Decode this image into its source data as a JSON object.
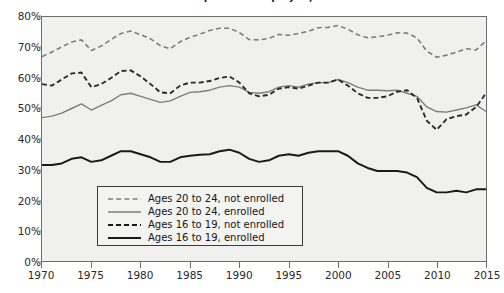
{
  "chart_data": {
    "type": "line",
    "title": "Percent of Population Employed, 1970-2015",
    "xlabel": "",
    "ylabel": "",
    "xlim": [
      1970,
      2015
    ],
    "ylim": [
      0,
      80
    ],
    "grid": false,
    "legend_position": "lower-left-inside",
    "x_tick_labels": [
      "1970",
      "1975",
      "1980",
      "1985",
      "1990",
      "1995",
      "2000",
      "2005",
      "2010",
      "2015"
    ],
    "x_tick_values": [
      1970,
      1975,
      1980,
      1985,
      1990,
      1995,
      2000,
      2005,
      2010,
      2015
    ],
    "y_tick_labels": [
      "0%",
      "10%",
      "20%",
      "30%",
      "40%",
      "50%",
      "60%",
      "70%",
      "80%"
    ],
    "y_tick_values": [
      0,
      10,
      20,
      30,
      40,
      50,
      60,
      70,
      80
    ],
    "x": [
      1970,
      1971,
      1972,
      1973,
      1974,
      1975,
      1976,
      1977,
      1978,
      1979,
      1980,
      1981,
      1982,
      1983,
      1984,
      1985,
      1986,
      1987,
      1988,
      1989,
      1990,
      1991,
      1992,
      1993,
      1994,
      1995,
      1996,
      1997,
      1998,
      1999,
      2000,
      2001,
      2002,
      2003,
      2004,
      2005,
      2006,
      2007,
      2008,
      2009,
      2010,
      2011,
      2012,
      2013,
      2014,
      2015
    ],
    "series": [
      {
        "name": "Ages 20 to 24, not enrolled",
        "style": "dashed-light",
        "color": "#7d7d7d",
        "values": [
          67.0,
          68.5,
          70.2,
          71.8,
          72.5,
          69.0,
          70.5,
          72.6,
          74.6,
          75.4,
          74.2,
          72.8,
          70.6,
          69.6,
          71.9,
          73.3,
          74.4,
          75.6,
          76.3,
          76.3,
          74.9,
          72.6,
          72.5,
          73.0,
          74.3,
          74.0,
          74.6,
          75.3,
          76.5,
          76.6,
          77.2,
          76.0,
          74.2,
          73.2,
          73.5,
          74.0,
          74.8,
          74.7,
          73.2,
          68.8,
          66.8,
          67.5,
          68.5,
          69.6,
          69.2,
          72.2
        ]
      },
      {
        "name": "Ages 20 to 24, enrolled",
        "style": "solid-light",
        "color": "#7d7d7d",
        "values": [
          47.0,
          47.5,
          48.5,
          50.0,
          51.5,
          49.5,
          51.0,
          52.5,
          54.5,
          55.0,
          54.0,
          53.0,
          52.0,
          52.5,
          54.0,
          55.3,
          55.5,
          56.0,
          57.0,
          57.5,
          57.0,
          55.3,
          55.0,
          55.5,
          57.0,
          57.5,
          57.0,
          58.0,
          58.5,
          58.5,
          59.5,
          58.5,
          57.0,
          56.0,
          56.0,
          55.8,
          56.0,
          55.0,
          54.0,
          50.5,
          49.0,
          48.8,
          49.5,
          50.2,
          51.2,
          49.0
        ]
      },
      {
        "name": "Ages 16 to 19, not enrolled",
        "style": "dashed-dark",
        "color": "#2a2a2a",
        "values": [
          58.0,
          57.5,
          59.5,
          61.5,
          61.8,
          57.0,
          58.0,
          60.0,
          62.3,
          62.5,
          60.5,
          58.0,
          55.3,
          55.0,
          57.5,
          58.5,
          58.5,
          59.0,
          60.0,
          60.5,
          58.5,
          55.0,
          54.0,
          54.5,
          56.5,
          57.0,
          56.5,
          57.5,
          58.5,
          58.5,
          59.5,
          57.5,
          55.0,
          53.5,
          53.5,
          54.0,
          55.5,
          56.0,
          53.5,
          46.0,
          43.0,
          46.5,
          47.5,
          48.0,
          50.5,
          55.0
        ]
      },
      {
        "name": "Ages 16 to 19, enrolled",
        "style": "solid-dark",
        "color": "#1a1a1a",
        "values": [
          31.5,
          31.5,
          32.0,
          33.5,
          34.0,
          32.5,
          33.0,
          34.5,
          36.0,
          36.0,
          35.0,
          34.0,
          32.5,
          32.5,
          34.0,
          34.5,
          34.8,
          35.0,
          36.0,
          36.5,
          35.5,
          33.5,
          32.5,
          33.0,
          34.5,
          35.0,
          34.5,
          35.5,
          36.0,
          36.0,
          36.0,
          34.5,
          32.0,
          30.5,
          29.5,
          29.5,
          29.5,
          29.0,
          27.5,
          24.0,
          22.5,
          22.5,
          23.0,
          22.5,
          23.5,
          23.5
        ]
      }
    ]
  },
  "legend": {
    "items": [
      {
        "label": "Ages 20 to 24, not enrolled",
        "style": "dashed-light"
      },
      {
        "label": "Ages 20 to 24, enrolled",
        "style": "solid-light"
      },
      {
        "label": "Ages 16 to 19, not enrolled",
        "style": "dashed-dark"
      },
      {
        "label": "Ages 16 to 19, enrolled",
        "style": "solid-dark"
      }
    ]
  },
  "colors": {
    "plot_background": "#f0f0ee",
    "frame": "#6d6d6d",
    "light_series": "#7d7d7d",
    "dark_series": "#1a1a1a",
    "text": "#2a2a2a"
  }
}
